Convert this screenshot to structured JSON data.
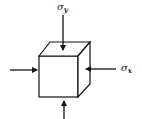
{
  "diagram": {
    "labels": {
      "sigma_y": {
        "symbol": "σ",
        "subscript": "y"
      },
      "sigma_x": {
        "symbol": "σ",
        "subscript": "x"
      }
    },
    "colors": {
      "stroke": "#111111",
      "background": "#ffffff",
      "text": "#222222"
    }
  }
}
